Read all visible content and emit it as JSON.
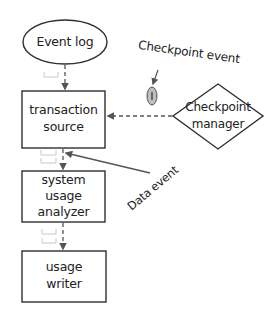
{
  "diagram": {
    "type": "flowchart",
    "style": "hand-drawn sketch",
    "colors": {
      "stroke": "#2f2f2f",
      "arrow": "#555555",
      "token_fill": "#bdbdbd",
      "envelope": "#c8c8c8",
      "background": "#ffffff"
    },
    "nodes": [
      {
        "id": "event_log",
        "shape": "ellipse",
        "label": "Event log"
      },
      {
        "id": "transaction_source",
        "shape": "rectangle",
        "label_lines": [
          "transaction",
          "source"
        ]
      },
      {
        "id": "system_usage_analyzer",
        "shape": "rectangle",
        "label_lines": [
          "system",
          "usage",
          "analyzer"
        ]
      },
      {
        "id": "usage_writer",
        "shape": "rectangle",
        "label_lines": [
          "usage",
          "writer"
        ]
      },
      {
        "id": "checkpoint_manager",
        "shape": "diamond",
        "label_lines": [
          "Checkpoint",
          "manager"
        ]
      }
    ],
    "edges": [
      {
        "from": "event_log",
        "to": "transaction_source",
        "style": "dashed"
      },
      {
        "from": "transaction_source",
        "to": "system_usage_analyzer",
        "style": "dashed"
      },
      {
        "from": "system_usage_analyzer",
        "to": "usage_writer",
        "style": "dashed"
      },
      {
        "from": "checkpoint_manager",
        "to": "transaction_source",
        "style": "dashed"
      }
    ],
    "annotations": {
      "checkpoint_event": "Checkpoint event",
      "data_event": "Data event"
    }
  }
}
